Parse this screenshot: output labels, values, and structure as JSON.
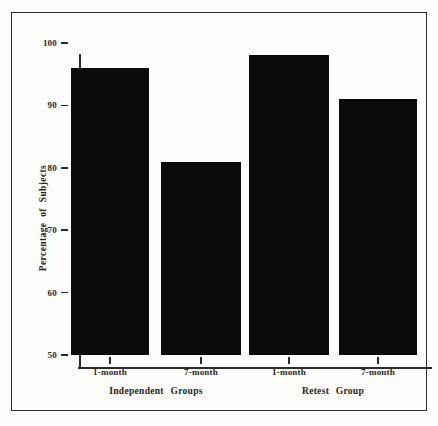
{
  "chart_data": {
    "type": "bar",
    "title": "",
    "xlabel": "",
    "ylabel": "Percentage of Subjects",
    "ylim": [
      50,
      100
    ],
    "yticks": [
      50,
      60,
      70,
      80,
      90,
      100
    ],
    "ytick_labels": [
      "50",
      "60",
      "70",
      "80",
      "90",
      "100"
    ],
    "grid": false,
    "legend": "none",
    "categories": [
      "1-month",
      "7-month",
      "1-month",
      "7-month"
    ],
    "values": [
      96,
      81,
      98,
      91
    ],
    "bar_color": "#0b0b0b",
    "groups": [
      {
        "label": "Independent Groups",
        "categories": [
          "1-month",
          "7-month"
        ],
        "values": [
          96,
          81
        ]
      },
      {
        "label": "Retest Group",
        "categories": [
          "1-month",
          "7-month"
        ],
        "values": [
          98,
          91
        ]
      }
    ],
    "annotations": []
  },
  "figure": {
    "frame_color": "#2b2b2b",
    "background_color": "#fcfcfb"
  }
}
